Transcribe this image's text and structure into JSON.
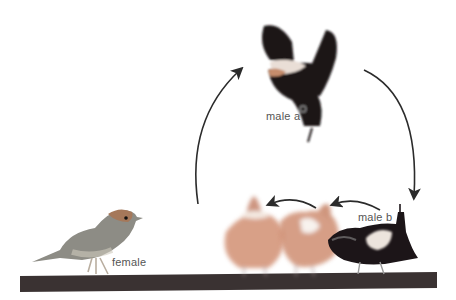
{
  "labels": {
    "female": "female",
    "male_a": "male a",
    "male_b": "male b"
  },
  "colors": {
    "branch": "#3a3232",
    "female_body": "#8a8a82",
    "female_head": "#a07a5e",
    "male_black": "#1c1518",
    "male_white_patch": "#f2ece6",
    "ghost_bird": "#c98a6e",
    "arrow": "#2b2b2b"
  }
}
